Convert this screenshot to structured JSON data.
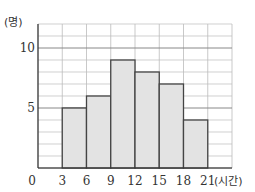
{
  "chart_data": {
    "type": "bar",
    "subtype": "histogram",
    "title": "",
    "xlabel": "(시간)",
    "ylabel": "(명)",
    "x_ticks": [
      "0",
      "3",
      "6",
      "9",
      "12",
      "15",
      "18",
      "21"
    ],
    "y_ticks": [
      "5",
      "10"
    ],
    "categories": [
      "3~6",
      "6~9",
      "9~12",
      "12~15",
      "15~18",
      "18~21"
    ],
    "bins": [
      [
        3,
        6
      ],
      [
        6,
        9
      ],
      [
        9,
        12
      ],
      [
        12,
        15
      ],
      [
        15,
        18
      ],
      [
        18,
        21
      ]
    ],
    "values": [
      5,
      6,
      9,
      8,
      7,
      4
    ],
    "xlim": [
      0,
      24
    ],
    "ylim": [
      0,
      12
    ],
    "grid": true,
    "grid_step_x": 3,
    "grid_step_y": 2,
    "bar_color": "#e3e3e3",
    "edge_color": "#444444",
    "grid_color": "#bbbbbb"
  }
}
